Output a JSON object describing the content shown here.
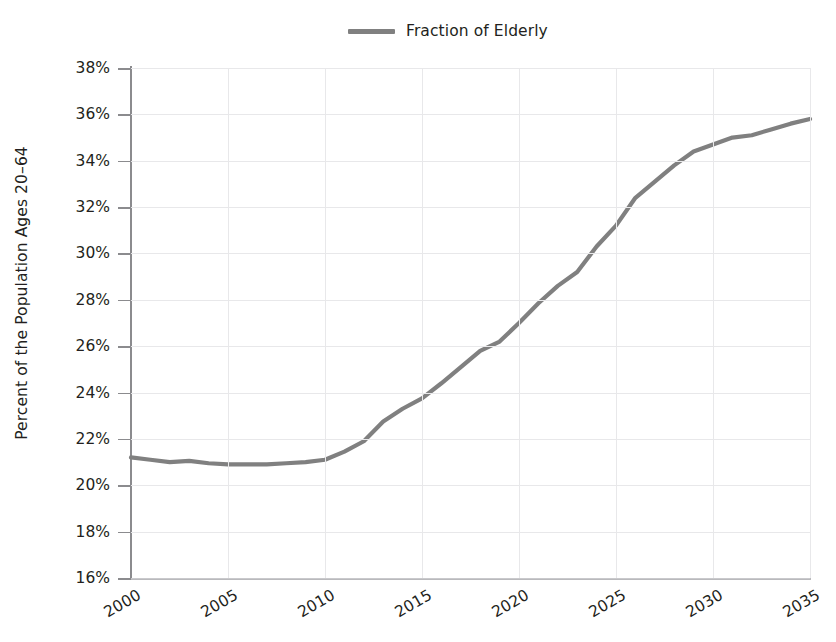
{
  "chart_data": {
    "type": "line",
    "title": "",
    "subtitle": "",
    "xlabel": "",
    "ylabel": "Percent of the Population Ages 20–64",
    "legend": {
      "position": "top-center",
      "entries": [
        {
          "name": "Fraction of Elderly",
          "color": "#808080"
        }
      ]
    },
    "grid": true,
    "xlim": [
      2000,
      2035
    ],
    "ylim": [
      16,
      38
    ],
    "y_tick_labels": [
      "38%",
      "36%",
      "34%",
      "32%",
      "30%",
      "28%",
      "26%",
      "24%",
      "22%",
      "20%",
      "18%",
      "16%"
    ],
    "y_ticks": [
      38,
      36,
      34,
      32,
      30,
      28,
      26,
      24,
      22,
      20,
      18,
      16
    ],
    "y_unit": "%",
    "x_tick_labels": [
      "2000",
      "2005",
      "2010",
      "2015",
      "2020",
      "2025",
      "2030",
      "2035"
    ],
    "x_ticks": [
      2000,
      2005,
      2010,
      2015,
      2020,
      2025,
      2030,
      2035
    ],
    "x": [
      2000,
      2001,
      2002,
      2003,
      2004,
      2005,
      2006,
      2007,
      2008,
      2009,
      2010,
      2011,
      2012,
      2013,
      2014,
      2015,
      2016,
      2017,
      2018,
      2019,
      2020,
      2021,
      2022,
      2023,
      2024,
      2025,
      2026,
      2027,
      2028,
      2029,
      2030,
      2031,
      2032,
      2033,
      2034,
      2035
    ],
    "series": [
      {
        "name": "Fraction of Elderly",
        "color": "#808080",
        "values": [
          21.2,
          21.1,
          21.0,
          21.05,
          20.95,
          20.9,
          20.9,
          20.9,
          20.95,
          21.0,
          21.1,
          21.45,
          21.9,
          22.75,
          23.3,
          23.75,
          24.4,
          25.1,
          25.8,
          26.2,
          27.0,
          27.85,
          28.6,
          29.2,
          30.3,
          31.2,
          32.4,
          33.1,
          33.8,
          34.4,
          34.7,
          35.0,
          35.1,
          35.35,
          35.6,
          35.8
        ]
      }
    ]
  }
}
